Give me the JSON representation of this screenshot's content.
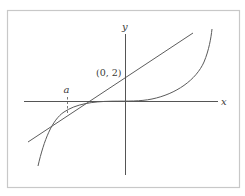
{
  "figure": {
    "colors": {
      "frame": "#c8c8c8",
      "axes": "#555555",
      "curve": "#5a5a5a",
      "tangent": "#4a4a4a",
      "text": "#3a3a3a"
    },
    "axes": {
      "x_label": "x",
      "y_label": "y"
    },
    "labels": {
      "intercept": "(0, 2)",
      "tangent_point": "a"
    },
    "elements": {
      "curve": "function curve, flat near origin, steep at both ends",
      "tangent_line": "line tangent to the curve at x = a",
      "dashed_marker": "dashed vertical segment from x-axis at x = a to the curve"
    }
  }
}
